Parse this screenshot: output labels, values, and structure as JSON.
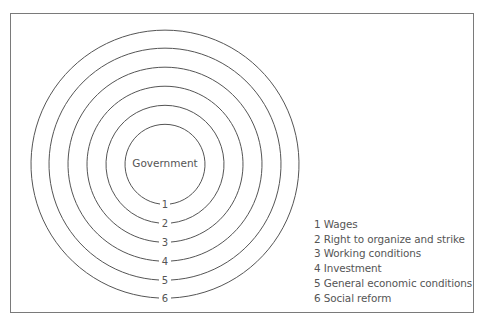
{
  "diagram": {
    "center_label": "Government",
    "rings": [
      {
        "number": "1",
        "label": "Wages"
      },
      {
        "number": "2",
        "label": "Right to organize and strike"
      },
      {
        "number": "3",
        "label": "Working conditions"
      },
      {
        "number": "4",
        "label": "Investment"
      },
      {
        "number": "5",
        "label": "General economic conditions"
      },
      {
        "number": "6",
        "label": "Social reform"
      }
    ]
  },
  "legend": {
    "items": [
      "1 Wages",
      "2 Right to organize and strike",
      "3 Working conditions",
      "4 Investment",
      "5 General economic conditions",
      "6 Social reform"
    ]
  }
}
